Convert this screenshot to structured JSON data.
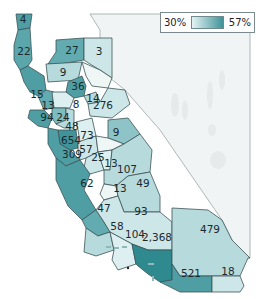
{
  "legend": {
    "min_label": "30%",
    "max_label": "57%",
    "color_min": "#e4f3f4",
    "color_max": "#3f9399"
  },
  "colors": {
    "background": "#ffffff",
    "nevada_fill": "#f1f4f4",
    "border": "#3d5457",
    "ocean_islands": "#8fb8bb"
  },
  "counties": [
    {
      "id": "del-norte",
      "value": "4"
    },
    {
      "id": "humboldt",
      "value": "22"
    },
    {
      "id": "shasta",
      "value": "27"
    },
    {
      "id": "lassen",
      "value": "3"
    },
    {
      "id": "tehama",
      "value": "9"
    },
    {
      "id": "mendocino",
      "value": "15"
    },
    {
      "id": "sonoma",
      "value": "13"
    },
    {
      "id": "sacramento",
      "value": "36"
    },
    {
      "id": "yolo",
      "value": "8"
    },
    {
      "id": "amador",
      "value": "14"
    },
    {
      "id": "placer",
      "value": "276"
    },
    {
      "id": "marin",
      "value": "94"
    },
    {
      "id": "napa",
      "value": "24"
    },
    {
      "id": "solano",
      "value": "48"
    },
    {
      "id": "san-francisco",
      "value": "654"
    },
    {
      "id": "san-joaquin",
      "value": "73"
    },
    {
      "id": "alameda",
      "value": "309"
    },
    {
      "id": "stanislaus",
      "value": "57"
    },
    {
      "id": "mono",
      "value": "9"
    },
    {
      "id": "merced",
      "value": "25"
    },
    {
      "id": "mariposa",
      "value": "13"
    },
    {
      "id": "fresno",
      "value": "107"
    },
    {
      "id": "kings",
      "value": "13"
    },
    {
      "id": "tulare",
      "value": "49"
    },
    {
      "id": "monterey",
      "value": "62"
    },
    {
      "id": "san-luis-obispo",
      "value": "47"
    },
    {
      "id": "kern",
      "value": "93"
    },
    {
      "id": "santa-barbara",
      "value": "58"
    },
    {
      "id": "ventura",
      "value": "104"
    },
    {
      "id": "los-angeles",
      "value": "2,368"
    },
    {
      "id": "san-bernardino",
      "value": "479"
    },
    {
      "id": "san-diego",
      "value": "521"
    },
    {
      "id": "imperial",
      "value": "18"
    }
  ]
}
